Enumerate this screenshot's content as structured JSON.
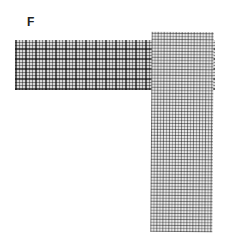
{
  "figure": {
    "panel_label": "F",
    "strips": [
      {
        "name": "horizontal-strip",
        "pattern": "dark plaid",
        "color": "#6a6a6a"
      },
      {
        "name": "vertical-strip",
        "pattern": "light plaid",
        "color": "#8c8c8c"
      }
    ]
  }
}
